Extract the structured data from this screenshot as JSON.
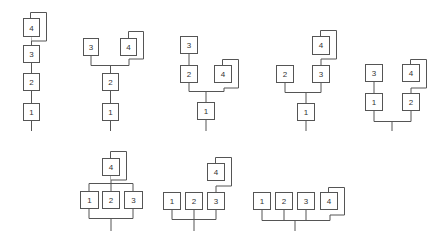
{
  "style": {
    "stroke": "#555555",
    "label_color": "#333333",
    "background": "#ffffff"
  },
  "diagrams": [
    {
      "id": "d1",
      "description": "Linear chain 1-2-3-4, node 4 has stacked backing",
      "nodes": [
        {
          "label": "1",
          "x": 23,
          "y": 103
        },
        {
          "label": "2",
          "x": 23,
          "y": 73
        },
        {
          "label": "3",
          "x": 23,
          "y": 45
        },
        {
          "label": "4",
          "x": 23,
          "y": 18,
          "stacked": true
        }
      ]
    },
    {
      "id": "d2",
      "description": "1-2 chain, 2 branches to 3 and 4",
      "nodes": [
        {
          "label": "1",
          "x": 102,
          "y": 103
        },
        {
          "label": "2",
          "x": 102,
          "y": 73
        },
        {
          "label": "3",
          "x": 83,
          "y": 38
        },
        {
          "label": "4",
          "x": 120,
          "y": 38,
          "stacked": true
        }
      ]
    },
    {
      "id": "d3",
      "description": "1 branches to 2 (with 3 above) and 4",
      "nodes": [
        {
          "label": "1",
          "x": 197,
          "y": 102
        },
        {
          "label": "2",
          "x": 180,
          "y": 65
        },
        {
          "label": "3",
          "x": 180,
          "y": 36
        },
        {
          "label": "4",
          "x": 214,
          "y": 65,
          "stacked": true
        }
      ]
    },
    {
      "id": "d4",
      "description": "1 branches to 2 and 3, 4 above 3",
      "nodes": [
        {
          "label": "1",
          "x": 297,
          "y": 103
        },
        {
          "label": "2",
          "x": 276,
          "y": 65
        },
        {
          "label": "3",
          "x": 312,
          "y": 65
        },
        {
          "label": "4",
          "x": 312,
          "y": 36,
          "stacked": true
        }
      ]
    },
    {
      "id": "d5",
      "description": "Root branches to 1 and 2; 3 above 1, 4 above 2",
      "nodes": [
        {
          "label": "1",
          "x": 365,
          "y": 93
        },
        {
          "label": "2",
          "x": 402,
          "y": 93
        },
        {
          "label": "3",
          "x": 365,
          "y": 64
        },
        {
          "label": "4",
          "x": 402,
          "y": 64,
          "stacked": true
        }
      ]
    },
    {
      "id": "d6",
      "description": "Root to 1,2,3 in parallel, then 4 above",
      "nodes": [
        {
          "label": "1",
          "x": 80,
          "y": 191
        },
        {
          "label": "2",
          "x": 102,
          "y": 191
        },
        {
          "label": "3",
          "x": 124,
          "y": 191
        },
        {
          "label": "4",
          "x": 102,
          "y": 158,
          "stacked": true
        }
      ]
    },
    {
      "id": "d7",
      "description": "Root to 1,2,3; 4 above 3",
      "nodes": [
        {
          "label": "1",
          "x": 163,
          "y": 192
        },
        {
          "label": "2",
          "x": 185,
          "y": 192
        },
        {
          "label": "3",
          "x": 207,
          "y": 192
        },
        {
          "label": "4",
          "x": 207,
          "y": 163,
          "stacked": true
        }
      ]
    },
    {
      "id": "d8",
      "description": "Root to 1,2,3,4 in parallel",
      "nodes": [
        {
          "label": "1",
          "x": 253,
          "y": 192
        },
        {
          "label": "2",
          "x": 275,
          "y": 192
        },
        {
          "label": "3",
          "x": 297,
          "y": 192
        },
        {
          "label": "4",
          "x": 320,
          "y": 192,
          "stacked": true
        }
      ]
    }
  ]
}
